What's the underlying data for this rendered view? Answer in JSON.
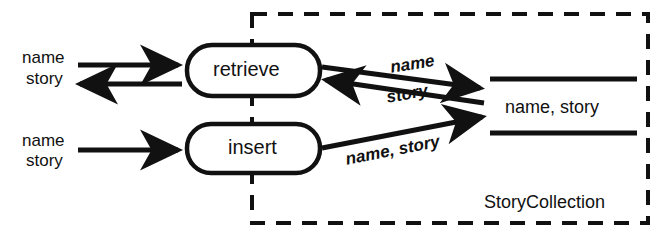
{
  "diagram": {
    "type": "data-flow-diagram",
    "boundary": {
      "label": "StoryCollection",
      "style": "dashed"
    },
    "processes": [
      {
        "id": "retrieve",
        "label": "retrieve",
        "shape": "rounded-rectangle"
      },
      {
        "id": "insert",
        "label": "insert",
        "shape": "rounded-rectangle"
      }
    ],
    "datastores": [
      {
        "id": "store",
        "label": "name, story",
        "shape": "open-ended-rectangle"
      }
    ],
    "external_flows": [
      {
        "id": "retrieve-in",
        "label": "name",
        "direction": "in",
        "target": "retrieve"
      },
      {
        "id": "retrieve-out",
        "label": "story",
        "direction": "out",
        "source": "retrieve"
      },
      {
        "id": "insert-in-name",
        "label": "name",
        "direction": "in",
        "target": "insert"
      },
      {
        "id": "insert-in-story",
        "label": "story",
        "direction": "in",
        "target": "insert"
      }
    ],
    "internal_flows": [
      {
        "id": "retrieve-to-store",
        "label": "name",
        "from": "retrieve",
        "to": "store"
      },
      {
        "id": "store-to-retrieve",
        "label": "story",
        "from": "store",
        "to": "retrieve"
      },
      {
        "id": "insert-to-store",
        "label": "name, story",
        "from": "insert",
        "to": "store"
      }
    ],
    "colors": {
      "stroke": "#111111",
      "background": "#ffffff"
    }
  }
}
